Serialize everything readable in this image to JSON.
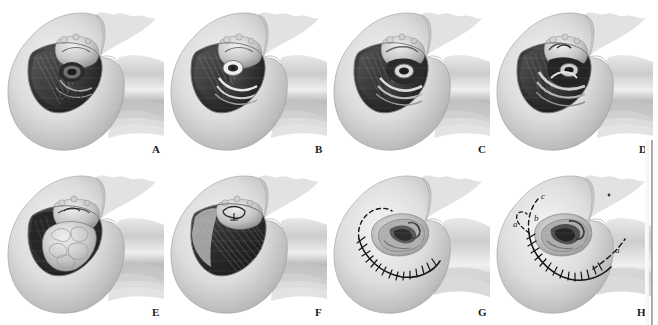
{
  "figure": {
    "background_color": "#ffffff",
    "ink_color": "#1b1b1b",
    "layout": {
      "rows": 2,
      "columns": 4,
      "panel_count": 8
    }
  },
  "panels": [
    {
      "letter": "A",
      "caption": "Exposed mastoid cavity with labyrinth and facial nerve displayed",
      "stage": "initial-exposure",
      "has_sutures": false,
      "has_dashed_incision": false,
      "cavity_fill": "bone-and-labyrinth"
    },
    {
      "letter": "B",
      "caption": "Deeper dissection, internal auditory canal opened",
      "stage": "deep-dissection",
      "has_sutures": false,
      "has_dashed_incision": false,
      "cavity_fill": "bone-and-canal"
    },
    {
      "letter": "C",
      "caption": "Further drill-out of petrous bone",
      "stage": "petrous-drill-out",
      "has_sutures": false,
      "has_dashed_incision": false,
      "cavity_fill": "bone-and-canal"
    },
    {
      "letter": "D",
      "caption": "Completed bone removal with dura and nerve visible",
      "stage": "completed-resection",
      "has_sutures": false,
      "has_dashed_incision": false,
      "cavity_fill": "dura-and-nerve"
    },
    {
      "letter": "E",
      "caption": "Cavity obliterated with abdominal fat graft",
      "stage": "fat-graft-obliteration",
      "has_sutures": false,
      "has_dashed_incision": false,
      "cavity_fill": "fat-graft"
    },
    {
      "letter": "F",
      "caption": "Temporalis muscle flap rotated over the cavity",
      "stage": "muscle-flap-coverage",
      "has_sutures": false,
      "has_dashed_incision": false,
      "cavity_fill": "muscle-flap"
    },
    {
      "letter": "G",
      "caption": "Skin closed with interrupted sutures around the auricle",
      "stage": "skin-closure",
      "has_sutures": true,
      "has_dashed_incision": true,
      "cavity_fill": "closed-skin"
    },
    {
      "letter": "H",
      "caption": "Closure with alternative incision extensions indicated",
      "stage": "closure-with-extensions",
      "has_sutures": true,
      "has_dashed_incision": true,
      "cavity_fill": "closed-skin",
      "annotations": [
        {
          "label": "a",
          "note": "anterior/inferior extension"
        },
        {
          "label": "b",
          "note": "middle limb of incision"
        },
        {
          "label": "c",
          "note": "superior extension"
        },
        {
          "label": "a",
          "note": "posterior extension"
        }
      ]
    }
  ],
  "panel_letters": [
    "A",
    "B",
    "C",
    "D",
    "E",
    "F",
    "G",
    "H"
  ],
  "annotation_labels": {
    "a": "a",
    "b": "b",
    "c": "c",
    "a2": "a"
  }
}
